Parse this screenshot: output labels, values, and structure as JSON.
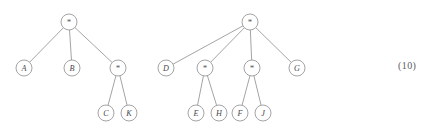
{
  "figure": {
    "caption_number": "(10)",
    "background_color": "#ffffff",
    "stroke_color": "#8d8d8f",
    "text_color": "#4a4a4c",
    "node_radius": 8,
    "trees": [
      {
        "id": "tree-left",
        "root": "n1",
        "nodes": [
          {
            "id": "n1",
            "label": "*",
            "kind": "operator",
            "x": 69,
            "y": 22
          },
          {
            "id": "n2",
            "label": "A",
            "kind": "leaf",
            "x": 24,
            "y": 68
          },
          {
            "id": "n3",
            "label": "B",
            "kind": "leaf",
            "x": 72,
            "y": 68
          },
          {
            "id": "n4",
            "label": "*",
            "kind": "operator",
            "x": 118,
            "y": 68
          },
          {
            "id": "n5",
            "label": "C",
            "kind": "leaf",
            "x": 106,
            "y": 113
          },
          {
            "id": "n6",
            "label": "K",
            "kind": "leaf",
            "x": 129,
            "y": 113
          }
        ],
        "edges": [
          {
            "from": "n1",
            "to": "n2"
          },
          {
            "from": "n1",
            "to": "n3"
          },
          {
            "from": "n1",
            "to": "n4"
          },
          {
            "from": "n4",
            "to": "n5"
          },
          {
            "from": "n4",
            "to": "n6"
          }
        ]
      },
      {
        "id": "tree-right",
        "root": "m1",
        "nodes": [
          {
            "id": "m1",
            "label": "*",
            "kind": "operator",
            "x": 250,
            "y": 22
          },
          {
            "id": "m2",
            "label": "D",
            "kind": "leaf",
            "x": 166,
            "y": 68
          },
          {
            "id": "m3",
            "label": "*",
            "kind": "operator",
            "x": 205,
            "y": 68
          },
          {
            "id": "m4",
            "label": "*",
            "kind": "operator",
            "x": 252,
            "y": 68
          },
          {
            "id": "m5",
            "label": "G",
            "kind": "leaf",
            "x": 297,
            "y": 68
          },
          {
            "id": "m6",
            "label": "E",
            "kind": "leaf",
            "x": 196,
            "y": 113
          },
          {
            "id": "m7",
            "label": "H",
            "kind": "leaf",
            "x": 219,
            "y": 113
          },
          {
            "id": "m8",
            "label": "F",
            "kind": "leaf",
            "x": 240,
            "y": 113
          },
          {
            "id": "m9",
            "label": "J",
            "kind": "leaf",
            "x": 263,
            "y": 113
          }
        ],
        "edges": [
          {
            "from": "m1",
            "to": "m2"
          },
          {
            "from": "m1",
            "to": "m3"
          },
          {
            "from": "m1",
            "to": "m4"
          },
          {
            "from": "m1",
            "to": "m5"
          },
          {
            "from": "m3",
            "to": "m6"
          },
          {
            "from": "m3",
            "to": "m7"
          },
          {
            "from": "m4",
            "to": "m8"
          },
          {
            "from": "m4",
            "to": "m9"
          }
        ]
      }
    ]
  }
}
